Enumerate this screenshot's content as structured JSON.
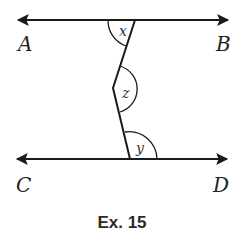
{
  "figure": {
    "caption": "Ex. 15",
    "points": {
      "A": "A",
      "B": "B",
      "C": "C",
      "D": "D"
    },
    "angles": {
      "x": "x",
      "z": "z",
      "y": "y"
    },
    "lines": [
      {
        "name": "AB",
        "type": "line",
        "arrows": "both"
      },
      {
        "name": "CD",
        "type": "line",
        "arrows": "both"
      },
      {
        "name": "transversal",
        "type": "bent-segment",
        "vertex": "z"
      }
    ],
    "colors": {
      "stroke": "#1a1a1a",
      "text": "#222222"
    }
  }
}
